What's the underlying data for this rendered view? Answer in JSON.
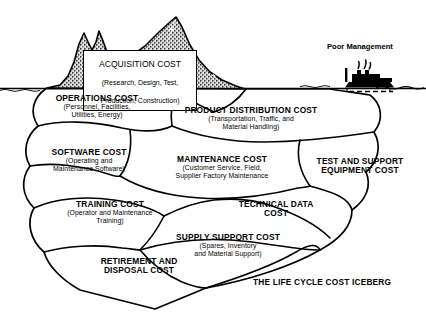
{
  "figure": {
    "caption": "THE LIFE CYCLE COST ICEBERG",
    "ship_label": "Poor Management",
    "waterline_color": "#000000",
    "tip_fill_color": "#8a8a8a",
    "outline_color": "#000000",
    "background_color": "#ffffff"
  },
  "tip": {
    "title": "ACQUISITION COST",
    "detail_line1": "(Research, Design, Test,",
    "detail_line2": "Production, Construction)"
  },
  "segments": [
    {
      "id": "operations",
      "title": "OPERATIONS COST",
      "detail_line1": "(Personnel, Facilities,",
      "detail_line2": "Utilities, Energy)"
    },
    {
      "id": "product-distribution",
      "title": "PRODUCT DISTRIBUTION COST",
      "detail_line1": "(Transportation, Traffic, and",
      "detail_line2": "Material Handling)"
    },
    {
      "id": "software",
      "title": "SOFTWARE COST",
      "detail_line1": "(Operating and",
      "detail_line2": "Maintenance Software)"
    },
    {
      "id": "maintenance",
      "title": "MAINTENANCE COST",
      "detail_line1": "(Customer Service, Field,",
      "detail_line2": "Supplier Factory Maintenance"
    },
    {
      "id": "test-and-support",
      "title_line1": "TEST AND SUPPORT",
      "title_line2": "EQUIPMENT COST"
    },
    {
      "id": "training",
      "title": "TRAINING COST",
      "detail_line1": "(Operator and Maintenance",
      "detail_line2": "Training)"
    },
    {
      "id": "technical-data",
      "title_line1": "TECHNICAL DATA",
      "title_line2": "COST"
    },
    {
      "id": "supply-support",
      "title": "SUPPLY SUPPORT COST",
      "detail_line1": "(Spares, Inventory",
      "detail_line2": "and Material Support)"
    },
    {
      "id": "retirement-and-disposal",
      "title_line1": "RETIREMENT AND",
      "title_line2": "DISPOSAL COST"
    }
  ]
}
